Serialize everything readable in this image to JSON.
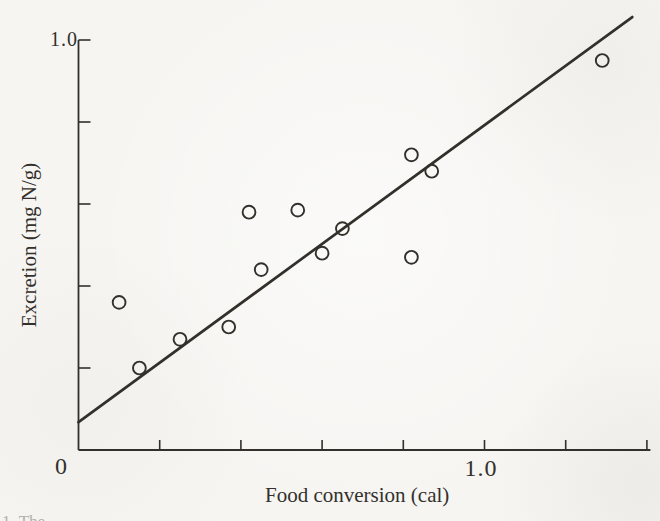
{
  "figure": {
    "paper_color": "#f6f5f2",
    "ink_color": "#33302b",
    "caption_fragment": "1. The"
  },
  "chart_data": {
    "type": "scatter",
    "title": "",
    "xlabel": "Food conversion (cal)",
    "ylabel": "Excretion (mg N/g)",
    "xlim": [
      0,
      1.4
    ],
    "ylim": [
      0,
      1.0
    ],
    "x_ticks": [
      0.2,
      0.4,
      0.6,
      0.8,
      1.0,
      1.2,
      1.4
    ],
    "y_ticks": [
      0.2,
      0.4,
      0.6,
      0.8,
      1.0
    ],
    "x_axis_labels": [
      {
        "value": 0,
        "label": "0"
      },
      {
        "value": 1.0,
        "label": "1.0"
      }
    ],
    "y_axis_labels": [
      {
        "value": 1.0,
        "label": "1.0"
      }
    ],
    "grid": false,
    "legend": null,
    "marker": "open-circle",
    "points": [
      [
        0.1,
        0.36
      ],
      [
        0.15,
        0.2
      ],
      [
        0.25,
        0.27
      ],
      [
        0.37,
        0.3
      ],
      [
        0.42,
        0.58
      ],
      [
        0.45,
        0.44
      ],
      [
        0.54,
        0.585
      ],
      [
        0.6,
        0.48
      ],
      [
        0.65,
        0.54
      ],
      [
        0.82,
        0.72
      ],
      [
        0.82,
        0.47
      ],
      [
        0.87,
        0.68
      ],
      [
        1.29,
        0.95
      ]
    ],
    "fit_line": {
      "x": [
        0,
        1.364
      ],
      "y": [
        0.068,
        1.056
      ]
    }
  }
}
